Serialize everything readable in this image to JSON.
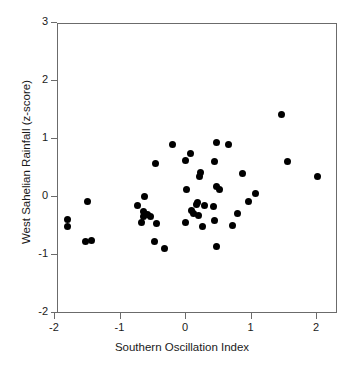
{
  "chart_data": {
    "type": "scatter",
    "title": "",
    "xlabel": "Southern Oscillation Index",
    "ylabel": "West Sahelian Rainfall (z-score)",
    "xlim": [
      -2.05,
      2.2
    ],
    "ylim": [
      -2,
      3
    ],
    "grid": false,
    "legend": null,
    "xticks": [
      -2,
      -1,
      0,
      1,
      2
    ],
    "xticklabels": [
      "-2",
      "-1",
      "0",
      "1",
      "2"
    ],
    "yticks": [
      -2,
      -1,
      0,
      1,
      2,
      3
    ],
    "yticklabels": [
      "-2",
      "-1",
      "0",
      "1",
      "2",
      "3"
    ],
    "marker": "filled-circle",
    "marker_color": "#000000",
    "axis_color": "#6b6b6b",
    "points": [
      {
        "x": -1.8,
        "y": -0.41
      },
      {
        "x": -1.8,
        "y": -0.52
      },
      {
        "x": -1.49,
        "y": -0.09
      },
      {
        "x": -1.52,
        "y": -0.78
      },
      {
        "x": -1.42,
        "y": -0.77
      },
      {
        "x": -0.72,
        "y": -0.16
      },
      {
        "x": -0.62,
        "y": -0.01
      },
      {
        "x": -0.64,
        "y": -0.27
      },
      {
        "x": -0.58,
        "y": -0.32
      },
      {
        "x": -0.66,
        "y": -0.45
      },
      {
        "x": -0.63,
        "y": -0.36
      },
      {
        "x": -0.52,
        "y": -0.35
      },
      {
        "x": -0.45,
        "y": 0.56
      },
      {
        "x": -0.44,
        "y": -0.47
      },
      {
        "x": -0.47,
        "y": -0.79
      },
      {
        "x": -0.32,
        "y": -0.91
      },
      {
        "x": -0.19,
        "y": 0.88
      },
      {
        "x": 0.0,
        "y": 0.62
      },
      {
        "x": 0.0,
        "y": -0.45
      },
      {
        "x": 0.02,
        "y": 0.11
      },
      {
        "x": 0.09,
        "y": 0.73
      },
      {
        "x": 0.1,
        "y": -0.25
      },
      {
        "x": 0.13,
        "y": -0.31
      },
      {
        "x": 0.18,
        "y": -0.14
      },
      {
        "x": 0.2,
        "y": -0.33
      },
      {
        "x": 0.22,
        "y": 0.33
      },
      {
        "x": 0.24,
        "y": 0.41
      },
      {
        "x": 0.19,
        "y": -0.11
      },
      {
        "x": 0.27,
        "y": -0.53
      },
      {
        "x": 0.3,
        "y": -0.17
      },
      {
        "x": 0.45,
        "y": 0.6
      },
      {
        "x": 0.48,
        "y": 0.92
      },
      {
        "x": 0.48,
        "y": 0.16
      },
      {
        "x": 0.44,
        "y": -0.18
      },
      {
        "x": 0.45,
        "y": -0.42
      },
      {
        "x": 0.48,
        "y": -0.87
      },
      {
        "x": 0.52,
        "y": 0.11
      },
      {
        "x": 0.67,
        "y": 0.88
      },
      {
        "x": 0.73,
        "y": -0.51
      },
      {
        "x": 0.8,
        "y": -0.3
      },
      {
        "x": 0.88,
        "y": 0.39
      },
      {
        "x": 0.97,
        "y": -0.09
      },
      {
        "x": 1.08,
        "y": 0.04
      },
      {
        "x": 1.47,
        "y": 1.41
      },
      {
        "x": 1.56,
        "y": 0.6
      },
      {
        "x": 2.03,
        "y": 0.33
      }
    ]
  }
}
